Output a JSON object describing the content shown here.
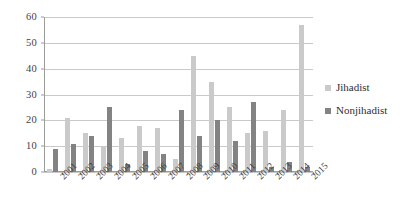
{
  "chart_data": {
    "type": "bar",
    "title": "",
    "subtitle": "",
    "xlabel": "",
    "ylabel": "",
    "ylim": [
      0,
      60
    ],
    "ytick_step": 10,
    "yticks": [
      "0",
      "10",
      "20",
      "30",
      "40",
      "50",
      "60"
    ],
    "grid": true,
    "legend_position": "right",
    "categories": [
      "2001",
      "2002",
      "2003",
      "2004",
      "2005",
      "2006",
      "2007",
      "2008",
      "2009",
      "2010",
      "2011",
      "2012",
      "2013",
      "2014",
      "2015"
    ],
    "series": [
      {
        "name": "Jihadist",
        "color": "#cacaca",
        "values": [
          1,
          21,
          15,
          10,
          13,
          18,
          17,
          5,
          45,
          35,
          25,
          15,
          16,
          24,
          57
        ]
      },
      {
        "name": "Nonjihadist",
        "color": "#838383",
        "values": [
          9,
          11,
          14,
          25,
          3,
          8,
          7,
          24,
          14,
          20,
          12,
          27,
          2,
          4,
          2
        ]
      }
    ]
  },
  "legend": {
    "items": [
      {
        "label": "Jihadist",
        "swatch": "jihadist"
      },
      {
        "label": "Nonjihadist",
        "swatch": "nonjihadist"
      }
    ]
  },
  "colors": {
    "jihadist": "#cacaca",
    "nonjihadist": "#838383",
    "gridline": "#c9c9c9",
    "axis": "#9c9c9c",
    "text": "#3f3f3f",
    "background": "#ffffff"
  }
}
